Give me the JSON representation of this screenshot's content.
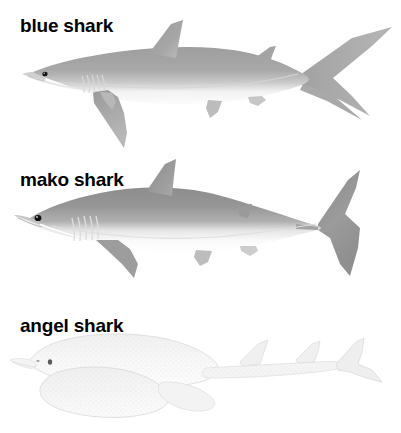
{
  "figure": {
    "background_color": "#ffffff",
    "text_color": "#000000",
    "width": 401,
    "height": 433
  },
  "species": [
    {
      "id": "blue-shark",
      "label": "blue shark",
      "illustration_name": "blue-shark-illustration",
      "label_position": {
        "x": 20,
        "y": 16
      },
      "body_color": "#9a9a9a",
      "belly_color": "#f2f2f2",
      "outline_color": "#8a8a8a",
      "orientation": "facing-left",
      "features": [
        "long pointed snout",
        "large triangular dorsal fin",
        "very long sickle-shaped pectoral fins",
        "small second dorsal fin",
        "anal fin",
        "heterocercal caudal fin with long upper lobe",
        "five gill slits",
        "round black eye"
      ]
    },
    {
      "id": "mako-shark",
      "label": "mako shark",
      "illustration_name": "mako-shark-illustration",
      "label_position": {
        "x": 20,
        "y": 170
      },
      "body_color": "#8e8e8e",
      "belly_color": "#ededed",
      "outline_color": "#7c7c7c",
      "orientation": "facing-left",
      "features": [
        "conical pointed snout",
        "stout torpedo-shaped body",
        "tall triangular dorsal fin",
        "moderate pectoral fins",
        "keeled caudal peduncle",
        "crescent-shaped lunate caudal fin",
        "five gill slits",
        "large round black eye"
      ]
    },
    {
      "id": "angel-shark",
      "label": "angel shark",
      "illustration_name": "angel-shark-illustration",
      "label_position": {
        "x": 20,
        "y": 316
      },
      "body_color": "#f4f4f4",
      "belly_color": "#fbfbfb",
      "outline_color": "#dcdcdc",
      "orientation": "facing-left",
      "features": [
        "flattened ray-like body",
        "broad wing-like pectoral fins",
        "blunt rounded snout",
        "two small dorsal fins set far back",
        "slender tail",
        "small eye on top of head",
        "speckled mottled skin"
      ]
    }
  ]
}
